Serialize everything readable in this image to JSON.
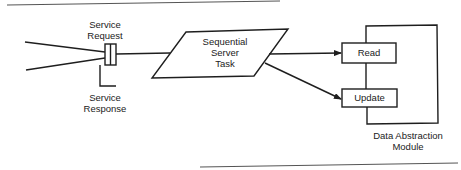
{
  "diagram": {
    "colors": {
      "stroke": "#1e1e1e",
      "text": "#222222",
      "background": "#ffffff",
      "rule": "#555555"
    },
    "connector": {
      "request_label": [
        "Service",
        "Request"
      ],
      "response_label": [
        "Service",
        "Response"
      ]
    },
    "task": {
      "label": [
        "Sequential",
        "Server",
        "Task"
      ],
      "shape": "parallelogram"
    },
    "module": {
      "label": [
        "Data Abstraction",
        "Module"
      ],
      "operations": [
        {
          "label": "Read"
        },
        {
          "label": "Update"
        }
      ]
    },
    "edges": [
      {
        "from": "client-1",
        "to": "connector"
      },
      {
        "from": "client-2",
        "to": "connector"
      },
      {
        "from": "connector",
        "to": "task"
      },
      {
        "from": "task",
        "to": "Read",
        "arrow": true
      },
      {
        "from": "task",
        "to": "Update",
        "arrow": true
      },
      {
        "from": "connector",
        "to": "response",
        "style": "elbow"
      }
    ]
  }
}
